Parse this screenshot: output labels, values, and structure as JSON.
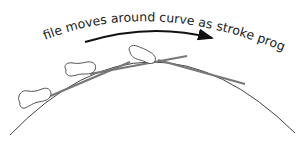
{
  "diagram": {
    "caption": "file moves around curve as stroke progresses",
    "elements": {
      "arrow": "direction-arrow",
      "curve": "workpiece-curve",
      "files": [
        "file-position-1",
        "file-position-2",
        "file-position-3"
      ]
    },
    "colors": {
      "stroke": "#333333",
      "file_outline": "#555555",
      "blade": "#777777"
    }
  }
}
